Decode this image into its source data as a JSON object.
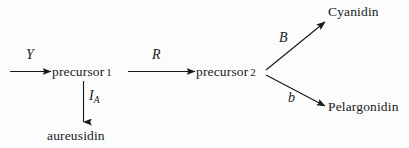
{
  "diagram": {
    "type": "pathway-flowchart",
    "background_color": "#fcfcfc",
    "stroke_color": "#1a1a1a",
    "nodes": [
      {
        "id": "precursor1",
        "label": "precursor",
        "number": "1"
      },
      {
        "id": "precursor2",
        "label": "precursor",
        "number": "2"
      },
      {
        "id": "aureusidin",
        "label": "aureusidin",
        "number": ""
      },
      {
        "id": "cyanidin",
        "label": "Cyanidin",
        "number": ""
      },
      {
        "id": "pelargonidin",
        "label": "Pelargonidin",
        "number": ""
      }
    ],
    "edge_labels": {
      "y": "Y",
      "r": "R",
      "ia_base": "I",
      "ia_sub": "A",
      "b_upper": "B",
      "b_lower": "b"
    },
    "edges": [
      {
        "from": "",
        "to": "precursor1",
        "label": "Y",
        "direction": "right"
      },
      {
        "from": "precursor1",
        "to": "precursor2",
        "label": "R",
        "direction": "right"
      },
      {
        "from": "precursor1",
        "to": "aureusidin",
        "label": "IA",
        "direction": "down"
      },
      {
        "from": "precursor2",
        "to": "cyanidin",
        "label": "B",
        "direction": "up-right"
      },
      {
        "from": "precursor2",
        "to": "pelargonidin",
        "label": "b",
        "direction": "down-right"
      }
    ]
  }
}
